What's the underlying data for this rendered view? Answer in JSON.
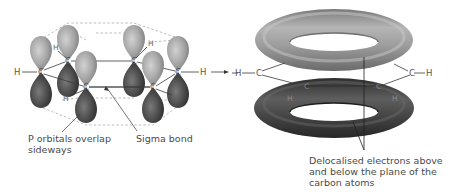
{
  "figure": {
    "left_panel": {
      "title": "Overlapping p orbitals in benzene",
      "atoms": {
        "c_left": "C",
        "c_upper_left": "C",
        "c_front_left": "C",
        "c_upper_right": "C",
        "c_right": "C",
        "c_front_right": "C",
        "h_left": "H",
        "h_upper_left": "H",
        "h_front_left": "H",
        "h_upper_right": "H",
        "h_right": "H",
        "h_front_right": "H"
      },
      "labels": {
        "p_orbitals_line1": "P orbitals overlap",
        "p_orbitals_line2": "sideways",
        "sigma_bond": "Sigma bond"
      }
    },
    "right_panel": {
      "title": "Delocalised pi electron rings",
      "atoms": {
        "h_left": "H",
        "c_left": "C",
        "c_front_left": "C",
        "h_front_left": "H",
        "c_right": "C",
        "h_right": "H",
        "c_front_right": "C",
        "h_front_right": "H"
      },
      "labels": {
        "delocalised_line1": "Delocalised electrons above",
        "delocalised_line2": "and below the  plane of the",
        "delocalised_line3": "carbon atoms"
      }
    },
    "colors": {
      "upper_lobe": "#a8a8a8",
      "lower_lobe": "#4a4a4a",
      "upper_torus": "#9a9a9a",
      "lower_torus": "#3e3e3e",
      "text": "#4a4a4a",
      "dashed": "#9a9a9a"
    }
  }
}
